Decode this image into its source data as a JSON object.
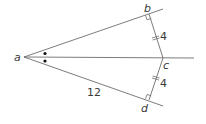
{
  "diagram": {
    "points": {
      "a": "a",
      "b": "b",
      "c": "c",
      "d": "d"
    },
    "segments": {
      "bc_length": "4",
      "cd_length": "4",
      "ad_length": "12"
    },
    "markings": {
      "angle_bisector_marks": "two dots indicating equal angles at a",
      "right_angles": [
        "b",
        "d"
      ],
      "equal_segments": [
        "bc",
        "cd"
      ]
    },
    "colors": {
      "line": "#6d6d6d",
      "text": "#3a3a3a",
      "dot": "#111111"
    }
  }
}
